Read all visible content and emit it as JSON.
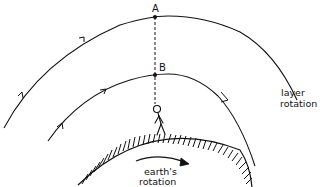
{
  "diagram": {
    "type": "physics-sketch",
    "labels": {
      "point_a": "A",
      "point_b": "B",
      "layer_rotation_line1": "layer",
      "layer_rotation_line2": "rotation",
      "earth_rotation_line1": "earth's",
      "earth_rotation_line2": "rotation"
    },
    "elements": {
      "outer_arc": "outer atmospheric layer through point A",
      "inner_arc": "inner atmospheric layer through point B",
      "dashed_line": "vertical line from observer to points B and A",
      "observer": "stick figure standing on earth",
      "earth_surface": "hatched arc representing earth's surface",
      "rotation_arrow": "curved arrow indicating earth's rotation"
    },
    "colors": {
      "ink": "#111111",
      "background": "#ffffff"
    }
  }
}
